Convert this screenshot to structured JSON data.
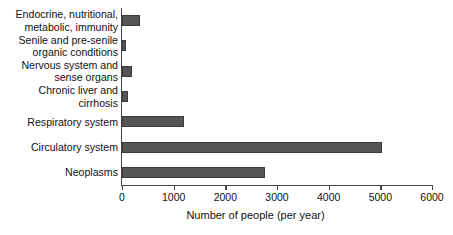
{
  "chart_data": {
    "type": "bar",
    "orientation": "horizontal",
    "title": "",
    "xlabel": "Number of people (per year)",
    "ylabel": "",
    "categories": [
      "Endocrine, nutritional,\nmetabolic, immunity",
      "Senile and pre-senile\norganic conditions",
      "Nervous system and\nsense organs",
      "Chronic liver and\ncirrhosis",
      "Respiratory system",
      "Circulatory system",
      "Neoplasms"
    ],
    "values": [
      340,
      80,
      200,
      120,
      1200,
      5030,
      2770
    ],
    "xlim": [
      0,
      6000
    ],
    "xticks": [
      0,
      1000,
      2000,
      3000,
      4000,
      5000,
      6000
    ],
    "xtick_labels": [
      "0",
      "1000",
      "2000",
      "3000",
      "4000",
      "5000",
      "6000"
    ],
    "grid": false,
    "legend": false,
    "bar_color": "#555555",
    "axis_color": "#444444",
    "background_color": "#ffffff"
  }
}
